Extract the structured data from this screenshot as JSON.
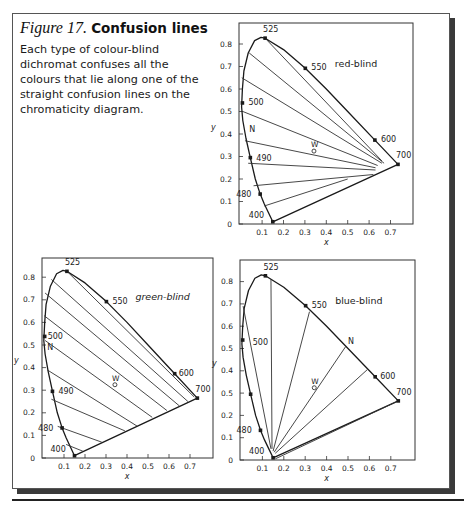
{
  "figure": {
    "number_label": "Figure 17.",
    "title": "Confusion lines",
    "caption": "Each type of colour-blind dichromat confuses all the colours that lie along one of the straight confusion lines on the chromaticity diagram."
  },
  "colors": {
    "ink": "#1a1a1a",
    "frame": "#555555",
    "shadow": "#3a3a3a"
  },
  "chart_data": [
    {
      "type": "line",
      "title": "red-blind",
      "xlabel": "x",
      "ylabel": "y",
      "xticks": [
        "0.1",
        "0.2",
        "0.3",
        "0.4",
        "0.5",
        "0.6",
        "0.7"
      ],
      "yticks": [
        "0",
        "0.1",
        "0.2",
        "0.3",
        "0.4",
        "0.5",
        "0.6",
        "0.7",
        "0.8"
      ],
      "xlim": [
        0,
        0.8
      ],
      "ylim": [
        0,
        0.85
      ],
      "box": {
        "left": 239,
        "top": 23,
        "right": 413,
        "bottom": 224,
        "x0": 240.7,
        "xscale": 214,
        "y0": 224,
        "yscale": 225
      },
      "copunctal_point": [
        0.735,
        0.265
      ],
      "confusion_lines": [
        [
          [
            0.12,
            0.82
          ],
          [
            0.66,
            0.28
          ]
        ],
        [
          [
            0.04,
            0.76
          ],
          [
            0.67,
            0.27
          ]
        ],
        [
          [
            0.005,
            0.65
          ],
          [
            0.66,
            0.27
          ]
        ],
        [
          [
            0.01,
            0.5
          ],
          [
            0.64,
            0.26
          ]
        ],
        [
          [
            0.02,
            0.37
          ],
          [
            0.63,
            0.25
          ]
        ],
        [
          [
            0.035,
            0.27
          ],
          [
            0.63,
            0.24
          ]
        ],
        [
          [
            0.06,
            0.17
          ],
          [
            0.62,
            0.22
          ]
        ],
        [
          [
            0.11,
            0.08
          ],
          [
            0.5,
            0.2
          ]
        ]
      ],
      "markers": [
        {
          "label": "525",
          "x": 0.114,
          "y": 0.826,
          "dx": -2,
          "dy": -6
        },
        {
          "label": "550",
          "x": 0.302,
          "y": 0.692,
          "dx": 6,
          "dy": 2
        },
        {
          "label": "600",
          "x": 0.627,
          "y": 0.373,
          "dx": 6,
          "dy": 2
        },
        {
          "label": "700",
          "x": 0.735,
          "y": 0.265,
          "dx": -2,
          "dy": -6
        },
        {
          "label": "500",
          "x": 0.008,
          "y": 0.538,
          "dx": 6,
          "dy": 2
        },
        {
          "label": "490",
          "x": 0.045,
          "y": 0.295,
          "dx": 6,
          "dy": 3
        },
        {
          "label": "480",
          "x": 0.091,
          "y": 0.133,
          "dx": -24,
          "dy": 3
        },
        {
          "label": "400",
          "x": 0.15,
          "y": 0.01,
          "dx": -24,
          "dy": -4
        }
      ],
      "neutral_label": {
        "label": "N",
        "x": 0.04,
        "y": 0.41
      },
      "white_point": {
        "label": "W",
        "x": 0.333,
        "y": 0.333
      }
    },
    {
      "type": "line",
      "title": "green-blind",
      "xlabel": "x",
      "ylabel": "y",
      "xticks": [
        "0.1",
        "0.2",
        "0.3",
        "0.4",
        "0.5",
        "0.6",
        "0.7"
      ],
      "yticks": [
        "0",
        "0.1",
        "0.2",
        "0.3",
        "0.4",
        "0.5",
        "0.6",
        "0.7",
        "0.8"
      ],
      "xlim": [
        0,
        0.8
      ],
      "ylim": [
        0,
        0.85
      ],
      "box": {
        "left": 42,
        "top": 258,
        "right": 213,
        "bottom": 458,
        "x0": 43,
        "xscale": 210,
        "y0": 458,
        "yscale": 226
      },
      "copunctal_point": [
        1.08,
        -0.08
      ],
      "confusion_lines": [
        [
          [
            0.11,
            0.83
          ],
          [
            0.72,
            0.27
          ]
        ],
        [
          [
            0.04,
            0.79
          ],
          [
            0.69,
            0.25
          ]
        ],
        [
          [
            0.01,
            0.73
          ],
          [
            0.65,
            0.23
          ]
        ],
        [
          [
            0.005,
            0.63
          ],
          [
            0.59,
            0.21
          ]
        ],
        [
          [
            0.01,
            0.52
          ],
          [
            0.52,
            0.18
          ]
        ],
        [
          [
            0.02,
            0.39
          ],
          [
            0.45,
            0.14
          ]
        ],
        [
          [
            0.04,
            0.26
          ],
          [
            0.39,
            0.12
          ]
        ],
        [
          [
            0.07,
            0.14
          ],
          [
            0.28,
            0.07
          ]
        ],
        [
          [
            0.11,
            0.06
          ],
          [
            0.19,
            0.03
          ]
        ]
      ],
      "markers": [
        {
          "label": "525",
          "x": 0.114,
          "y": 0.826,
          "dx": -2,
          "dy": -6
        },
        {
          "label": "550",
          "x": 0.302,
          "y": 0.692,
          "dx": 6,
          "dy": 2
        },
        {
          "label": "600",
          "x": 0.627,
          "y": 0.373,
          "dx": 4,
          "dy": 2
        },
        {
          "label": "700",
          "x": 0.735,
          "y": 0.265,
          "dx": -2,
          "dy": -6
        },
        {
          "label": "500",
          "x": 0.008,
          "y": 0.538,
          "dx": 3,
          "dy": 3
        },
        {
          "label": "490",
          "x": 0.045,
          "y": 0.295,
          "dx": 6,
          "dy": 3
        },
        {
          "label": "480",
          "x": 0.091,
          "y": 0.133,
          "dx": -24,
          "dy": 3
        },
        {
          "label": "400",
          "x": 0.15,
          "y": 0.01,
          "dx": -24,
          "dy": -4
        }
      ],
      "neutral_label": {
        "label": "N",
        "x": 0.02,
        "y": 0.48
      },
      "white_point": {
        "label": "W",
        "x": 0.333,
        "y": 0.333
      }
    },
    {
      "type": "line",
      "title": "blue-blind",
      "xlabel": "x",
      "ylabel": "y",
      "xticks": [
        "0.1",
        "0.2",
        "0.3",
        "0.4",
        "0.5",
        "0.6",
        "0.7"
      ],
      "yticks": [
        "0",
        "0.1",
        "0.2",
        "0.5",
        "0.4",
        "0.5",
        "0.6",
        "0.7",
        "0.8"
      ],
      "xlim": [
        0,
        0.8
      ],
      "ylim": [
        0,
        0.85
      ],
      "box": {
        "left": 240,
        "top": 260,
        "right": 415,
        "bottom": 460,
        "x0": 241,
        "xscale": 214,
        "y0": 460,
        "yscale": 223
      },
      "copunctal_point": [
        0.17,
        0.0
      ],
      "confusion_lines": [
        [
          [
            0.01,
            0.69
          ],
          [
            0.14,
            0.05
          ]
        ],
        [
          [
            0.14,
            0.81
          ],
          [
            0.145,
            0.05
          ]
        ],
        [
          [
            0.32,
            0.665
          ],
          [
            0.15,
            0.04
          ]
        ],
        [
          [
            0.49,
            0.51
          ],
          [
            0.155,
            0.035
          ]
        ],
        [
          [
            0.59,
            0.405
          ],
          [
            0.16,
            0.03
          ]
        ],
        [
          [
            0.735,
            0.265
          ],
          [
            0.16,
            0.005
          ]
        ]
      ],
      "markers": [
        {
          "label": "525",
          "x": 0.114,
          "y": 0.826,
          "dx": -2,
          "dy": -6
        },
        {
          "label": "550",
          "x": 0.302,
          "y": 0.692,
          "dx": 6,
          "dy": 2
        },
        {
          "label": "600",
          "x": 0.627,
          "y": 0.373,
          "dx": 5,
          "dy": 2
        },
        {
          "label": "700",
          "x": 0.735,
          "y": 0.265,
          "dx": -2,
          "dy": -6
        },
        {
          "label": "500",
          "x": 0.008,
          "y": 0.538,
          "dx": 10,
          "dy": 5
        },
        {
          "label": "",
          "x": 0.045,
          "y": 0.295,
          "dx": 0,
          "dy": 0
        },
        {
          "label": "480",
          "x": 0.091,
          "y": 0.133,
          "dx": -24,
          "dy": 3
        },
        {
          "label": "400",
          "x": 0.15,
          "y": 0.01,
          "dx": -24,
          "dy": -4
        }
      ],
      "neutral_label": {
        "label": "N",
        "x": 0.5,
        "y": 0.52
      },
      "white_point": {
        "label": "W",
        "x": 0.333,
        "y": 0.333
      }
    }
  ],
  "spectral_locus": [
    [
      0.15,
      0.01
    ],
    [
      0.13,
      0.05
    ],
    [
      0.11,
      0.09
    ],
    [
      0.091,
      0.133
    ],
    [
      0.068,
      0.2
    ],
    [
      0.045,
      0.295
    ],
    [
      0.025,
      0.38
    ],
    [
      0.01,
      0.46
    ],
    [
      0.004,
      0.52
    ],
    [
      0.008,
      0.6
    ],
    [
      0.015,
      0.68
    ],
    [
      0.035,
      0.76
    ],
    [
      0.065,
      0.815
    ],
    [
      0.095,
      0.83
    ],
    [
      0.114,
      0.826
    ],
    [
      0.2,
      0.775
    ],
    [
      0.302,
      0.692
    ],
    [
      0.4,
      0.6
    ],
    [
      0.5,
      0.5
    ],
    [
      0.627,
      0.373
    ],
    [
      0.735,
      0.265
    ]
  ]
}
